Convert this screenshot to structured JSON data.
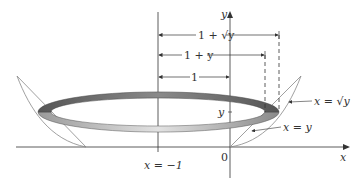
{
  "diagram": {
    "type": "solid-of-revolution",
    "axes": {
      "x_label": "x",
      "y_label": "y",
      "origin_label": "0"
    },
    "axis_of_rotation": {
      "label": "x = −1"
    },
    "dimensions": [
      {
        "label": "1 + √y"
      },
      {
        "label": "1 + y"
      },
      {
        "label": "1"
      }
    ],
    "curves": [
      {
        "label": "x = √y"
      },
      {
        "label": "x = y"
      }
    ],
    "y_marker": "y",
    "colors": {
      "ring_dark": "#6a6a6a",
      "ring_light": "#d0d0d0",
      "lines": "#333333"
    }
  }
}
